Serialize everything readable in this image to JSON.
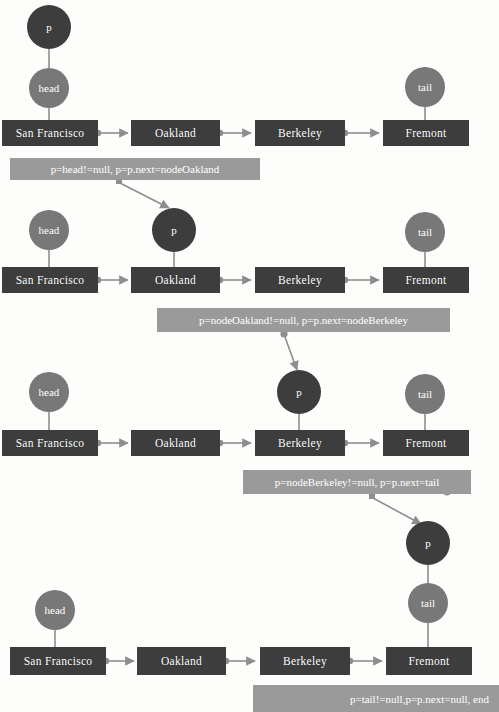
{
  "diagram": {
    "colors": {
      "node_box": "#3d3d3d",
      "pointer_p": "#3d3d3d",
      "pointer_head": "#787878",
      "pointer_tail": "#787878",
      "annotation_bg": "#9a9a9a",
      "connector": "#8e8e8e",
      "text": "#ffffff",
      "background": "#fdfdfc"
    },
    "node_labels": [
      "San Francisco",
      "Oakland",
      "Berkeley",
      "Fremont"
    ],
    "pointer_labels": {
      "p": "p",
      "head": "head",
      "tail": "tail"
    },
    "steps": [
      {
        "index": 1,
        "annotation": "p=head!=null, p=p.next=nodeOakland",
        "p_at": "San Francisco",
        "head_at": "San Francisco",
        "tail_at": "Fremont"
      },
      {
        "index": 2,
        "annotation": "p=nodeOakland!=null, p=p.next=nodeBerkeley",
        "p_at": "Oakland",
        "head_at": "San Francisco",
        "tail_at": "Fremont"
      },
      {
        "index": 3,
        "annotation": "p=nodeBerkeley!=null, p=p.next=tail",
        "p_at": "Berkeley",
        "head_at": "San Francisco",
        "tail_at": "Fremont"
      },
      {
        "index": 4,
        "annotation": "p=tail!=null,p=p.next=null, end",
        "p_at": "Fremont",
        "head_at": "San Francisco",
        "tail_at": "Fremont"
      }
    ]
  }
}
